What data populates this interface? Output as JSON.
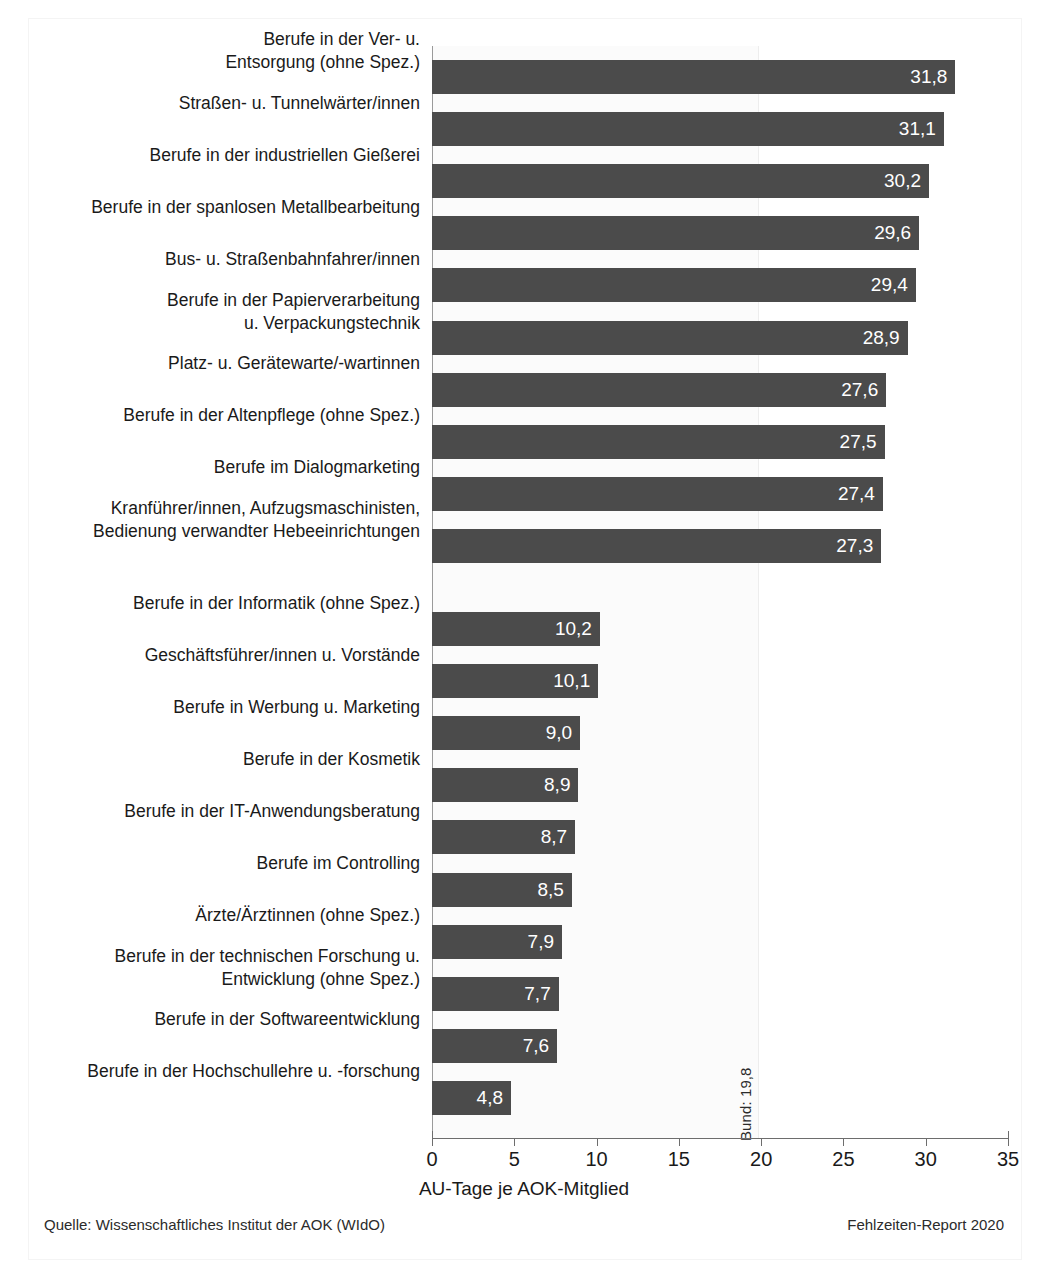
{
  "chart_data": {
    "type": "bar",
    "orientation": "horizontal",
    "title": "",
    "xlabel": "AU-Tage je AOK-Mitglied",
    "ylabel": "",
    "xlim": [
      0,
      35
    ],
    "xticks": [
      "0",
      "5",
      "10",
      "15",
      "20",
      "25",
      "30",
      "35"
    ],
    "xtick_values": [
      0,
      5,
      10,
      15,
      20,
      25,
      30,
      35
    ],
    "grid": false,
    "legend": null,
    "bar_color": "#4b4b4b",
    "value_label_color": "#ffffff",
    "reference_line": {
      "label": "Bund: 19,8",
      "value": 19.8,
      "orientation": "vertical",
      "rotation_deg": -90
    },
    "group_gap_after_index": 9,
    "categories": [
      "Berufe in der Ver- u.\nEntsorgung (ohne Spez.)",
      "Straßen- u. Tunnelwärter/innen",
      "Berufe in der industriellen Gießerei",
      "Berufe in der spanlosen Metallbearbeitung",
      "Bus- u. Straßenbahnfahrer/innen",
      "Berufe in der Papierverarbeitung\nu. Verpackungstechnik",
      "Platz- u. Gerätewarte/-wartinnen",
      "Berufe in der Altenpflege (ohne Spez.)",
      "Berufe im Dialogmarketing",
      "Kranführer/innen, Aufzugsmaschinisten,\nBedienung verwandter Hebeeinrichtungen",
      "Berufe in der Informatik (ohne Spez.)",
      "Geschäftsführer/innen u. Vorstände",
      "Berufe in Werbung u. Marketing",
      "Berufe in der Kosmetik",
      "Berufe in der IT-Anwendungsberatung",
      "Berufe im Controlling",
      "Ärzte/Ärztinnen (ohne Spez.)",
      "Berufe in der technischen Forschung u.\nEntwicklung (ohne Spez.)",
      "Berufe in der Softwareentwicklung",
      "Berufe in der Hochschullehre u. -forschung"
    ],
    "values": [
      31.8,
      31.1,
      30.2,
      29.6,
      29.4,
      28.9,
      27.6,
      27.5,
      27.4,
      27.3,
      10.2,
      10.1,
      9.0,
      8.9,
      8.7,
      8.5,
      7.9,
      7.7,
      7.6,
      4.8
    ],
    "value_labels": [
      "31,8",
      "31,1",
      "30,2",
      "29,6",
      "29,4",
      "28,9",
      "27,6",
      "27,5",
      "27,4",
      "27,3",
      "10,2",
      "10,1",
      "9,0",
      "8,9",
      "8,7",
      "8,5",
      "7,9",
      "7,7",
      "7,6",
      "4,8"
    ]
  },
  "footer": {
    "source": "Quelle: Wissenschaftliches Institut der AOK (WIdO)",
    "report": "Fehlzeiten-Report 2020"
  }
}
